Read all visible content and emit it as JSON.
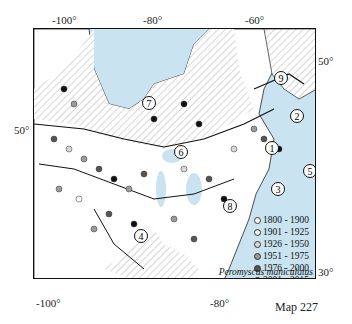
{
  "map": {
    "species": "Peromyscus maniculatus",
    "map_id": "Map 227",
    "top_axis": [
      "-100°",
      "-80°",
      "-60°"
    ],
    "bottom_axis": [
      "-100°",
      "-80°"
    ],
    "left_axis": [
      "50°"
    ],
    "right_axis": [
      "50°",
      "30°"
    ],
    "region_labels": [
      "1",
      "2",
      "3",
      "4",
      "5",
      "6",
      "7",
      "8",
      "9"
    ],
    "legend": [
      {
        "label": "1800 - 1900",
        "color": "#ffffff"
      },
      {
        "label": "1901 - 1925",
        "color": "#f2f2f2"
      },
      {
        "label": "1926 - 1950",
        "color": "#d8d8d8"
      },
      {
        "label": "1951 - 1975",
        "color": "#9a9a9a"
      },
      {
        "label": "1976 - 2000",
        "color": "#555555"
      },
      {
        "label": "2001 - 2015",
        "color": "#111111"
      }
    ],
    "colors": {
      "water": "#c9e3f0",
      "land": "#ffffff",
      "border": "#111111"
    }
  }
}
